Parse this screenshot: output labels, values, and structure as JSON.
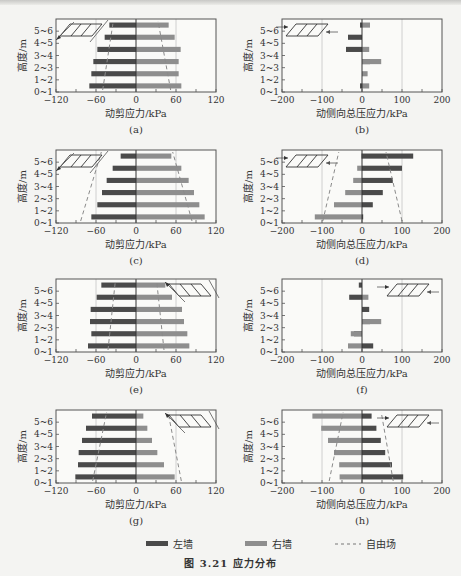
{
  "figure": {
    "title": "图 3.21   应力分布",
    "legend": {
      "left_wall": "左墙",
      "right_wall": "右墙",
      "free_field": "自由场"
    },
    "colors": {
      "left_wall": "#4a4a4a",
      "right_wall": "#8e8e8e",
      "free_field": "#8a8a8a",
      "axis": "#555555",
      "grid": "#c4c4c4"
    }
  },
  "chart_data": [
    {
      "id": "a",
      "caption": "(a)",
      "type": "bar",
      "title": "",
      "xlabel": "动剪应力/kPa",
      "ylabel": "高度/m",
      "categories": [
        "0~1",
        "1~2",
        "2~3",
        "3~4",
        "4~5",
        "5~6"
      ],
      "xlim": [
        -120,
        120
      ],
      "xticks": [
        -120,
        -60,
        0,
        60,
        120
      ],
      "series": [
        {
          "name": "左墙",
          "values": [
            -70,
            -67,
            -64,
            -58,
            -47,
            -40
          ]
        },
        {
          "name": "右墙",
          "values": [
            68,
            64,
            64,
            67,
            58,
            49
          ]
        },
        {
          "name": "自由场-left",
          "values": [
            -50,
            -48,
            -43,
            -41,
            -38,
            -34
          ],
          "style": "dashed"
        },
        {
          "name": "自由场-right",
          "values": [
            52,
            49,
            47,
            43,
            38,
            33
          ],
          "style": "dashed"
        }
      ],
      "grid_x": [
        -60,
        60
      ],
      "legend_position": "none",
      "annotation": "inset: shear box with arrows toward left"
    },
    {
      "id": "b",
      "caption": "(b)",
      "type": "bar",
      "title": "",
      "xlabel": "动侧向总压应力/kPa",
      "ylabel": "高度/m",
      "categories": [
        "0~1",
        "1~2",
        "2~3",
        "3~4",
        "4~5",
        "5~6"
      ],
      "xlim": [
        -200,
        200
      ],
      "xticks": [
        -200,
        -100,
        0,
        100,
        200
      ],
      "series": [
        {
          "name": "左墙",
          "values": [
            -5,
            0,
            20,
            -40,
            -35,
            -5
          ]
        },
        {
          "name": "右墙",
          "values": [
            18,
            14,
            48,
            18,
            0,
            20
          ]
        }
      ],
      "grid_x": [
        -100,
        100
      ],
      "legend_position": "none",
      "annotation": "inset: box with arrows pushing inward"
    },
    {
      "id": "c",
      "caption": "(c)",
      "type": "bar",
      "title": "",
      "xlabel": "动剪应力/kPa",
      "ylabel": "高度/m",
      "categories": [
        "0~1",
        "1~2",
        "2~3",
        "3~4",
        "4~5",
        "5~6"
      ],
      "xlim": [
        -120,
        120
      ],
      "xticks": [
        -120,
        -60,
        0,
        60,
        120
      ],
      "series": [
        {
          "name": "左墙",
          "values": [
            -67,
            -58,
            -51,
            -44,
            -35,
            -23
          ]
        },
        {
          "name": "右墙",
          "values": [
            103,
            95,
            87,
            79,
            68,
            53
          ]
        },
        {
          "name": "自由场-left",
          "values": [
            -83,
            -76,
            -70,
            -64,
            -58,
            -52
          ],
          "style": "dashed"
        },
        {
          "name": "自由场-right",
          "values": [
            84,
            79,
            73,
            68,
            63,
            55
          ],
          "style": "dashed"
        }
      ],
      "grid_x": [
        -60,
        60
      ],
      "legend_position": "none",
      "annotation": "inset: shear box with arrows toward left"
    },
    {
      "id": "d",
      "caption": "(d)",
      "type": "bar",
      "title": "",
      "xlabel": "动侧向总压应力/kPa",
      "ylabel": "高度/m",
      "categories": [
        "0~1",
        "1~2",
        "2~3",
        "3~4",
        "4~5",
        "5~6"
      ],
      "xlim": [
        -200,
        200
      ],
      "xticks": [
        -200,
        -100,
        0,
        100,
        200
      ],
      "series": [
        {
          "name": "左墙",
          "values": [
            3,
            27,
            52,
            77,
            100,
            128
          ]
        },
        {
          "name": "右墙",
          "values": [
            -118,
            -70,
            -42,
            -22,
            -12,
            -2
          ]
        },
        {
          "name": "自由场-left",
          "values": [
            -98,
            -90,
            -82,
            -74,
            -66,
            -58
          ],
          "style": "dashed"
        },
        {
          "name": "自由场-right",
          "values": [
            100,
            92,
            84,
            76,
            68,
            60
          ],
          "style": "dashed"
        }
      ],
      "grid_x": [
        -100,
        100
      ],
      "legend_position": "none",
      "annotation": "inset: box with arrows pushing inward"
    },
    {
      "id": "e",
      "caption": "(e)",
      "type": "bar",
      "title": "",
      "xlabel": "动剪应力/kPa",
      "ylabel": "高度/m",
      "categories": [
        "0~1",
        "1~2",
        "2~3",
        "3~4",
        "4~5",
        "5~6"
      ],
      "xlim": [
        -120,
        120
      ],
      "xticks": [
        -120,
        -60,
        0,
        60,
        120
      ],
      "series": [
        {
          "name": "左墙",
          "values": [
            -72,
            -67,
            -69,
            -68,
            -59,
            -52
          ]
        },
        {
          "name": "右墙",
          "values": [
            80,
            77,
            72,
            69,
            54,
            44
          ]
        },
        {
          "name": "自由场-left",
          "values": [
            -42,
            -41,
            -40,
            -38,
            -33,
            -31
          ],
          "style": "dashed"
        },
        {
          "name": "自由场-right",
          "values": [
            42,
            41,
            40,
            38,
            34,
            31
          ],
          "style": "dashed"
        }
      ],
      "grid_x": [
        -60,
        60
      ],
      "legend_position": "none",
      "annotation": "inset: shear box with arrows toward upper-left"
    },
    {
      "id": "f",
      "caption": "(f)",
      "type": "bar",
      "title": "",
      "xlabel": "动侧向总压应力/kPa",
      "ylabel": "高度/m",
      "categories": [
        "0~1",
        "1~2",
        "2~3",
        "3~4",
        "4~5",
        "5~6"
      ],
      "xlim": [
        -200,
        200
      ],
      "xticks": [
        -200,
        -100,
        0,
        100,
        200
      ],
      "series": [
        {
          "name": "左墙",
          "values": [
            28,
            -20,
            20,
            18,
            -32,
            -8
          ]
        },
        {
          "name": "右墙",
          "values": [
            -35,
            -28,
            48,
            0,
            16,
            0
          ]
        }
      ],
      "grid_x": [
        -100,
        100
      ],
      "legend_position": "none",
      "annotation": "inset: box with arrows pushing inward"
    },
    {
      "id": "g",
      "caption": "(g)",
      "type": "bar",
      "title": "",
      "xlabel": "动剪应力/kPa",
      "ylabel": "高度/m",
      "categories": [
        "0~1",
        "1~2",
        "2~3",
        "3~4",
        "4~5",
        "5~6"
      ],
      "xlim": [
        -120,
        120
      ],
      "xticks": [
        -120,
        -60,
        0,
        60,
        120
      ],
      "series": [
        {
          "name": "左墙",
          "values": [
            -91,
            -87,
            -86,
            -81,
            -75,
            -66
          ]
        },
        {
          "name": "右墙",
          "values": [
            58,
            42,
            32,
            24,
            17,
            11
          ]
        },
        {
          "name": "自由场-left",
          "values": [
            -65,
            -61,
            -57,
            -52,
            -48,
            -44
          ],
          "style": "dashed"
        },
        {
          "name": "自由场-right",
          "values": [
            68,
            64,
            60,
            56,
            52,
            48
          ],
          "style": "dashed"
        }
      ],
      "grid_x": [
        -60,
        60
      ],
      "legend_position": "none",
      "annotation": "inset: shear box with arrows toward upper-left"
    },
    {
      "id": "h",
      "caption": "(h)",
      "type": "bar",
      "title": "",
      "xlabel": "动侧向总压应力/kPa",
      "ylabel": "高度/m",
      "categories": [
        "0~1",
        "1~2",
        "2~3",
        "3~4",
        "4~5",
        "5~6"
      ],
      "xlim": [
        -200,
        200
      ],
      "xticks": [
        -200,
        -100,
        0,
        100,
        200
      ],
      "series": [
        {
          "name": "左墙",
          "values": [
            103,
            75,
            58,
            47,
            36,
            24
          ]
        },
        {
          "name": "右墙",
          "values": [
            -56,
            -57,
            -70,
            -85,
            -102,
            -124
          ]
        },
        {
          "name": "自由场-left",
          "values": [
            -82,
            -75,
            -68,
            -61,
            -54,
            -47
          ],
          "style": "dashed"
        },
        {
          "name": "自由场-right",
          "values": [
            78,
            72,
            66,
            60,
            54,
            48
          ],
          "style": "dashed"
        }
      ],
      "grid_x": [
        -100,
        100
      ],
      "legend_position": "none",
      "annotation": "inset: box with arrows pushing inward"
    }
  ]
}
